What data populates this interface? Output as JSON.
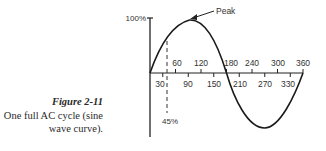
{
  "caption": {
    "figure_label": "Figure 2-11",
    "line1": "One full AC cycle (sine",
    "line2": "wave curve)."
  },
  "diagram": {
    "y_axis_max_label": "100%",
    "peak_label": "Peak",
    "dashed_marker_label": "45%",
    "upper_ticks": [
      "60",
      "120",
      "180",
      "240",
      "300",
      "360"
    ],
    "lower_ticks": [
      "30",
      "90",
      "150",
      "210",
      "270",
      "330"
    ],
    "colors": {
      "curve": "#1a1a1a",
      "text": "#333333"
    }
  }
}
